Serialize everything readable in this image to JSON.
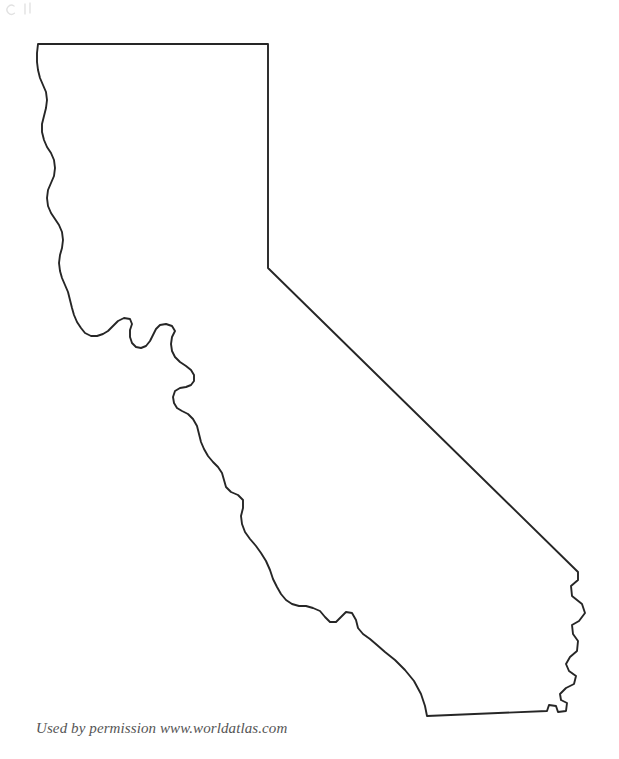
{
  "page": {
    "background_color": "#ffffff",
    "width": 619,
    "height": 759
  },
  "map": {
    "subject": "California",
    "type": "blank-outline-map",
    "outline_color": "#262626",
    "fill_color": "none",
    "stroke_width": 1.9,
    "labels": [],
    "borders": [
      {
        "name": "northern-border-oregon",
        "kind": "straight-horizontal"
      },
      {
        "name": "eastern-border-nevada-north",
        "kind": "straight-vertical"
      },
      {
        "name": "eastern-border-nevada-diagonal",
        "kind": "straight-diagonal"
      },
      {
        "name": "eastern-border-colorado-river",
        "kind": "irregular"
      },
      {
        "name": "southern-border-mexico",
        "kind": "straight-diagonal"
      },
      {
        "name": "western-border-pacific-coast",
        "kind": "irregular-coastline"
      }
    ],
    "landmark_features": [
      "san-francisco-bay-inlet",
      "point-conception-notch",
      "san-diego-corner",
      "nevada-corner"
    ]
  },
  "attribution": {
    "text": "Used by permission www.worldatlas.com",
    "color": "#555555"
  }
}
